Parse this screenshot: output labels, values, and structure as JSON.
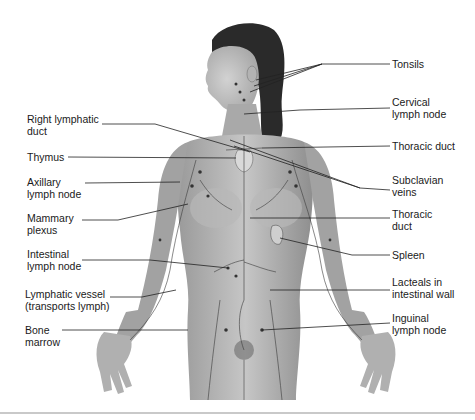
{
  "figure": {
    "labels_left": [
      {
        "id": "right-lymphatic-duct",
        "text": "Right lymphatic\nduct"
      },
      {
        "id": "thymus",
        "text": "Thymus"
      },
      {
        "id": "axillary-lymph-node",
        "text": "Axillary\nlymph node"
      },
      {
        "id": "mammary-plexus",
        "text": "Mammary\nplexus"
      },
      {
        "id": "intestinal-lymph-node",
        "text": "Intestinal\nlymph node"
      },
      {
        "id": "lymphatic-vessel",
        "text": "Lymphatic vessel\n(transports lymph)"
      },
      {
        "id": "bone-marrow",
        "text": "Bone\nmarrow"
      }
    ],
    "labels_right": [
      {
        "id": "tonsils",
        "text": "Tonsils"
      },
      {
        "id": "cervical-lymph-node",
        "text": "Cervical\nlymph node"
      },
      {
        "id": "thoracic-duct-upper",
        "text": "Thoracic duct"
      },
      {
        "id": "subclavian-veins",
        "text": "Subclavian\nveins"
      },
      {
        "id": "thoracic-duct-lower",
        "text": "Thoracic\nduct"
      },
      {
        "id": "spleen",
        "text": "Spleen"
      },
      {
        "id": "lacteals",
        "text": "Lacteals in\nintestinal wall"
      },
      {
        "id": "inguinal-lymph-node",
        "text": "Inguinal\nlymph node"
      }
    ]
  }
}
